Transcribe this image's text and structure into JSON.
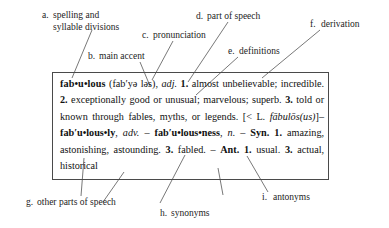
{
  "diagram": {
    "callouts": [
      {
        "letter": "a.",
        "label": "spelling and",
        "label2": "syllable divisions"
      },
      {
        "letter": "b.",
        "label": "main accent"
      },
      {
        "letter": "c.",
        "label": "pronunciation"
      },
      {
        "letter": "d.",
        "label": "part of speech"
      },
      {
        "letter": "e.",
        "label": "definitions"
      },
      {
        "letter": "f.",
        "label": "derivation"
      },
      {
        "letter": "g.",
        "label": "other parts of speech"
      },
      {
        "letter": "h.",
        "label": "synonyms"
      },
      {
        "letter": "i.",
        "label": "antonyms"
      }
    ]
  },
  "entry": {
    "headword": "fab•u•lous",
    "pronunciation": "(fab′yə ləs)",
    "part_of_speech": "adj.",
    "sense_1_num": "1.",
    "sense_1_text": "almost unbelievable; incredible.",
    "sense_2_num": "2.",
    "sense_2_text": "exceptionally good or unusual; marvelous; superb.",
    "sense_3_num": "3.",
    "sense_3_text": "told or known through fables, myths, or legends.",
    "derivation": "[< L. fābulōs(us)]",
    "derivation_prefix": "[< L. ",
    "derivation_latin": "fābulōs(us)",
    "derivation_suffix": "]",
    "dash": "–",
    "run_on_1": "fab′u•lous•ly",
    "run_on_1_pos": "adv.",
    "run_on_2": "fab′u•lous•ness",
    "run_on_2_pos": "n.",
    "comma": ",",
    "syn_label": "Syn.",
    "syn_1_num": "1.",
    "syn_1_text": "amazing, astonishing, astounding.",
    "syn_3_num": "3.",
    "syn_3_text": "fabled.",
    "ant_label": "Ant.",
    "ant_1_num": "1.",
    "ant_1_text": "usual.",
    "ant_3_num": "3.",
    "ant_3_text": "actual, historical"
  },
  "colors": {
    "box_border": "#4a4a4a",
    "leader_line": "#555555",
    "text": "#111111"
  }
}
